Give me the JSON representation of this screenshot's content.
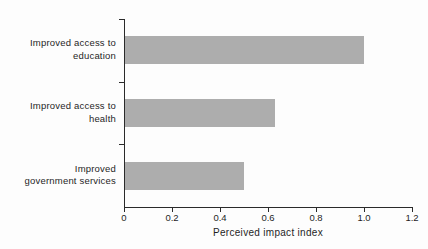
{
  "chart_data": {
    "type": "bar",
    "orientation": "horizontal",
    "title": "",
    "xlabel": "Perceived impact index",
    "ylabel": "",
    "categories": [
      "Improved access to education",
      "Improved access to health",
      "Improved government services"
    ],
    "category_label_lines": [
      [
        "Improved access to",
        "education"
      ],
      [
        "Improved access to",
        "health"
      ],
      [
        "Improved",
        "government services"
      ]
    ],
    "values": [
      1.0,
      0.63,
      0.5
    ],
    "xlim": [
      0,
      1.2
    ],
    "xticks": [
      0,
      0.2,
      0.4,
      0.6,
      0.8,
      1.0,
      1.2
    ],
    "xtick_labels": [
      "0",
      "0.2",
      "0.4",
      "0.6",
      "0.8",
      "1.0",
      "1.2"
    ],
    "grid": false,
    "legend": false,
    "bar_color": "#adadad",
    "axis_color": "#2a2a2a",
    "text_color": "#1f1f1f"
  }
}
